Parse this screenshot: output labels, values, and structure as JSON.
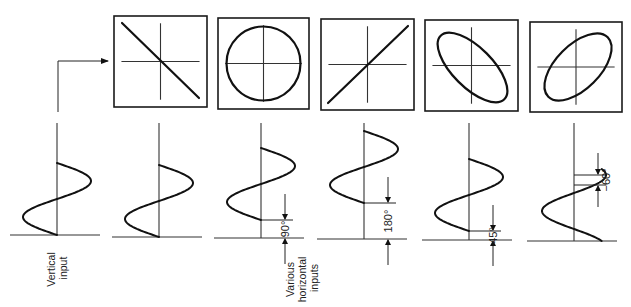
{
  "labels": {
    "vertical_input": [
      "Vertical",
      "input"
    ],
    "horizontal_inputs": [
      "Various",
      "horizontal",
      "inputs"
    ]
  },
  "colors": {
    "ink": "#111111",
    "background": "#ffffff"
  },
  "screens": [
    {
      "id": "screen-1",
      "x": 114,
      "y": 16,
      "w": 93,
      "h": 91,
      "pattern": "line-negative",
      "phase": "180°"
    },
    {
      "id": "screen-2",
      "x": 218,
      "y": 18,
      "w": 91,
      "h": 91,
      "pattern": "circle",
      "phase": "90°"
    },
    {
      "id": "screen-3",
      "x": 321,
      "y": 19,
      "w": 93,
      "h": 91,
      "pattern": "line-positive",
      "phase": "0°"
    },
    {
      "id": "screen-4",
      "x": 425,
      "y": 20,
      "w": 93,
      "h": 91,
      "pattern": "ellipse-negative",
      "phase": "135°"
    },
    {
      "id": "screen-5",
      "x": 530,
      "y": 22,
      "w": 92,
      "h": 90,
      "pattern": "ellipse-positive",
      "phase": "60°"
    }
  ],
  "waveforms": [
    {
      "id": "vertical-input",
      "axis_x": 57,
      "baseline_y": 235,
      "top_y": 123,
      "amp": 34,
      "span": 72,
      "phase_deg": 0,
      "dim_label": null
    },
    {
      "id": "horizontal-1",
      "axis_x": 159,
      "baseline_y": 237,
      "top_y": 123,
      "amp": 34,
      "span": 72,
      "phase_deg": 0,
      "dim_label": null
    },
    {
      "id": "horizontal-2",
      "axis_x": 261,
      "baseline_y": 238,
      "top_y": 123,
      "amp": 34,
      "span": 72,
      "phase_deg": 90,
      "dim_label": "90°"
    },
    {
      "id": "horizontal-3",
      "axis_x": 364,
      "baseline_y": 239,
      "top_y": 123,
      "amp": 34,
      "span": 72,
      "phase_deg": 180,
      "dim_label": "180°"
    },
    {
      "id": "horizontal-4",
      "axis_x": 469,
      "baseline_y": 240,
      "top_y": 123,
      "amp": 34,
      "span": 72,
      "phase_deg": 45,
      "dim_label": "45°"
    },
    {
      "id": "horizontal-5",
      "axis_x": 574,
      "baseline_y": 241,
      "top_y": 123,
      "amp": 32,
      "span": 72,
      "phase_deg": -60,
      "dim_label": "−60°"
    }
  ],
  "connector": {
    "from_x": 58,
    "from_y": 112,
    "corner_y": 61,
    "to_x": 108
  }
}
